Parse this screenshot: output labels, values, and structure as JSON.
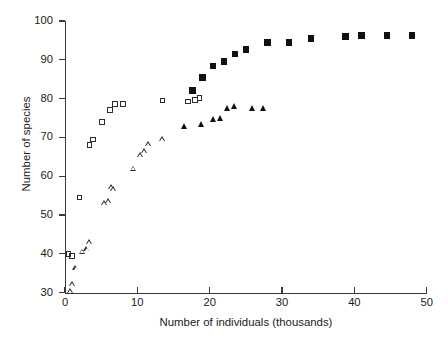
{
  "chart_data": {
    "type": "scatter",
    "title": "",
    "xlabel": "Number of individuals (thousands)",
    "ylabel": "Number of species",
    "xlim": [
      0,
      50
    ],
    "ylim": [
      30,
      100
    ],
    "xticks": [
      0,
      10,
      20,
      30,
      40,
      50
    ],
    "yticks": [
      30,
      40,
      50,
      60,
      70,
      80,
      90,
      100
    ],
    "xtick_labels": [
      "0",
      "10",
      "20",
      "30",
      "40",
      "50"
    ],
    "ytick_labels": [
      "30",
      "40",
      "50",
      "60",
      "70",
      "80",
      "90",
      "100"
    ],
    "grid": false,
    "legend": null,
    "series": [
      {
        "name": "open-square",
        "marker": "open-square",
        "color": "#2b2b2b",
        "points": [
          [
            0.5,
            40.0
          ],
          [
            1.0,
            39.4
          ],
          [
            2.0,
            54.5
          ],
          [
            3.4,
            68.0
          ],
          [
            3.9,
            69.5
          ],
          [
            5.1,
            74.0
          ],
          [
            6.2,
            77.0
          ],
          [
            6.9,
            78.6
          ],
          [
            8.0,
            78.6
          ],
          [
            13.5,
            79.5
          ],
          [
            17.0,
            79.2
          ],
          [
            18.0,
            79.6
          ],
          [
            18.6,
            80.2
          ]
        ]
      },
      {
        "name": "open-triangle",
        "marker": "open-triangle",
        "color": "#2b2b2b",
        "points": [
          [
            0.3,
            30.5
          ],
          [
            0.6,
            32.2
          ],
          [
            1.1,
            36.4
          ],
          [
            2.0,
            40.6
          ],
          [
            2.6,
            41.2
          ],
          [
            3.0,
            43.0
          ],
          [
            5.0,
            53.0
          ],
          [
            5.6,
            53.6
          ],
          [
            6.0,
            57.2
          ],
          [
            6.3,
            56.6
          ],
          [
            9.0,
            62.0
          ],
          [
            10.0,
            65.4
          ],
          [
            10.6,
            66.6
          ],
          [
            11.1,
            68.4
          ],
          [
            13.0,
            69.6
          ]
        ]
      },
      {
        "name": "filled-square",
        "marker": "filled-square",
        "color": "#111111",
        "points": [
          [
            17.6,
            82.0
          ],
          [
            19.0,
            85.4
          ],
          [
            20.5,
            88.4
          ],
          [
            22.0,
            89.5
          ],
          [
            23.5,
            91.5
          ],
          [
            25.0,
            92.6
          ],
          [
            28.0,
            94.4
          ],
          [
            31.0,
            94.5
          ],
          [
            34.0,
            95.4
          ],
          [
            38.8,
            96.1
          ],
          [
            41.0,
            96.2
          ],
          [
            44.5,
            96.3
          ],
          [
            48.0,
            96.3
          ]
        ]
      },
      {
        "name": "filled-triangle",
        "marker": "filled-triangle",
        "color": "#111111",
        "points": [
          [
            16.0,
            73.0
          ],
          [
            18.4,
            73.4
          ],
          [
            20.0,
            74.6
          ],
          [
            21.0,
            75.0
          ],
          [
            22.0,
            77.6
          ],
          [
            23.0,
            78.0
          ],
          [
            25.5,
            77.6
          ],
          [
            27.0,
            77.6
          ]
        ]
      }
    ]
  }
}
